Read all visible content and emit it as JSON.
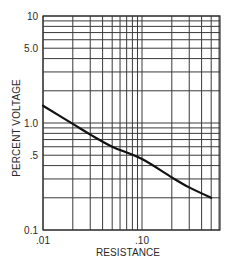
{
  "chart_data": {
    "type": "line",
    "title": "",
    "xlabel": "RESISTANCE",
    "ylabel": "PERCENT VOLTAGE",
    "xscale": "log",
    "yscale": "log",
    "xlim": [
      0.01,
      0.6
    ],
    "ylim": [
      0.1,
      10
    ],
    "grid": true,
    "legend": null,
    "x_tick_labels": [
      {
        "value": 0.01,
        "label": ".01"
      },
      {
        "value": 0.1,
        "label": ".10"
      }
    ],
    "y_tick_labels": [
      {
        "value": 10,
        "label": "10"
      },
      {
        "value": 5,
        "label": "5.0"
      },
      {
        "value": 1,
        "label": "1.0"
      },
      {
        "value": 0.5,
        "label": ".5"
      },
      {
        "value": 0.1,
        "label": "0.1"
      }
    ],
    "x_gridlines": [
      0.01,
      0.02,
      0.03,
      0.04,
      0.05,
      0.06,
      0.07,
      0.08,
      0.09,
      0.1,
      0.2,
      0.3,
      0.4,
      0.5,
      0.6
    ],
    "y_gridlines": [
      0.1,
      0.2,
      0.3,
      0.4,
      0.5,
      0.6,
      0.7,
      0.8,
      0.9,
      1,
      2,
      3,
      4,
      5,
      6,
      7,
      8,
      9,
      10
    ],
    "series": [
      {
        "name": "Percent Voltage vs Resistance",
        "x": [
          0.01,
          0.02,
          0.03,
          0.05,
          0.1,
          0.2,
          0.3,
          0.5
        ],
        "y": [
          1.45,
          0.98,
          0.78,
          0.6,
          0.46,
          0.31,
          0.25,
          0.2
        ]
      }
    ]
  }
}
